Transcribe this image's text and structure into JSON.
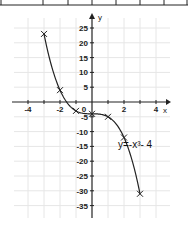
{
  "table_strip": {
    "cells": 8,
    "note_visible": "top edge of a value table, clipped"
  },
  "chart_data": {
    "type": "line",
    "title": "",
    "xlabel": "x",
    "ylabel": "y",
    "equation_label": "y=-x³- 4",
    "x_ticks": [
      -4,
      -2,
      0,
      2,
      4
    ],
    "x_tick_labels": [
      "-4",
      "-2",
      "0",
      "2",
      "4"
    ],
    "y_ticks": [
      25,
      20,
      15,
      10,
      5,
      -5,
      -10,
      -15,
      -20,
      -25,
      -30,
      -35
    ],
    "y_tick_labels": [
      "25",
      "20",
      "15",
      "10",
      "5",
      "-5",
      "-10",
      "-15",
      "-20",
      "-25",
      "-30",
      "-35"
    ],
    "xlim": [
      -4.5,
      4.7
    ],
    "ylim": [
      -37,
      28
    ],
    "grid": true,
    "series": [
      {
        "name": "y=-x^3-4",
        "marker": "x",
        "x": [
          -3,
          -2,
          -1,
          0,
          1,
          2,
          3
        ],
        "y": [
          23,
          4,
          -3,
          -4,
          -5,
          -12,
          -31
        ]
      }
    ],
    "colors": {
      "line": "#222222",
      "grid": "#e6e6e6",
      "axis": "#222222"
    }
  }
}
